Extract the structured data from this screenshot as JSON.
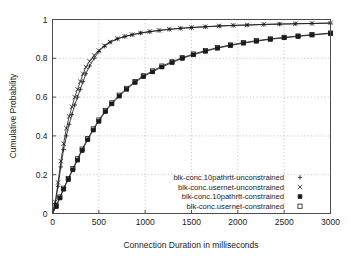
{
  "chart_data": {
    "type": "line",
    "title": "",
    "xlabel": "Connection Duration in milliseconds",
    "ylabel": "Cumulative Probability",
    "xlim": [
      0,
      3000
    ],
    "ylim": [
      0,
      1
    ],
    "xticks": [
      0,
      500,
      1000,
      1500,
      2000,
      2500,
      3000
    ],
    "xtick_labels": [
      "0",
      "500",
      "1000",
      "1500",
      "2000",
      "2500",
      "3000"
    ],
    "yticks": [
      0,
      0.2,
      0.4,
      0.6,
      0.8,
      1
    ],
    "ytick_labels": [
      "0",
      "0.2",
      "0.4",
      "0.6",
      "0.8",
      "1"
    ],
    "grid": true,
    "legend_position": "lower-right-inside",
    "series": [
      {
        "name": "blk-conc.10pathrtt-unconstrained",
        "marker": "plus",
        "marker_glyph": "+",
        "x": [
          0,
          30,
          60,
          90,
          120,
          150,
          180,
          210,
          240,
          270,
          300,
          330,
          360,
          400,
          450,
          500,
          560,
          620,
          700,
          780,
          860,
          950,
          1050,
          1150,
          1260,
          1380,
          1500,
          1650,
          1800,
          1950,
          2100,
          2280,
          2450,
          2620,
          2800,
          3000
        ],
        "y": [
          0.0,
          0.05,
          0.14,
          0.24,
          0.33,
          0.4,
          0.46,
          0.51,
          0.56,
          0.6,
          0.64,
          0.68,
          0.72,
          0.76,
          0.8,
          0.835,
          0.862,
          0.882,
          0.9,
          0.912,
          0.921,
          0.93,
          0.937,
          0.943,
          0.949,
          0.954,
          0.958,
          0.962,
          0.966,
          0.969,
          0.971,
          0.974,
          0.976,
          0.978,
          0.979,
          0.981
        ]
      },
      {
        "name": "blk-conc.usernet-unconstrained",
        "marker": "cross",
        "marker_glyph": "×",
        "x": [
          0,
          30,
          60,
          90,
          120,
          150,
          180,
          210,
          240,
          270,
          300,
          330,
          360,
          400,
          450,
          500,
          560,
          620,
          700,
          780,
          860,
          950,
          1050,
          1150,
          1260,
          1380,
          1500,
          1650,
          1800,
          1950,
          2100,
          2280,
          2450,
          2620,
          2800,
          3000
        ],
        "y": [
          0.0,
          0.06,
          0.16,
          0.27,
          0.36,
          0.44,
          0.5,
          0.55,
          0.6,
          0.64,
          0.68,
          0.72,
          0.755,
          0.785,
          0.815,
          0.84,
          0.865,
          0.884,
          0.901,
          0.913,
          0.922,
          0.931,
          0.938,
          0.944,
          0.95,
          0.955,
          0.959,
          0.963,
          0.967,
          0.97,
          0.972,
          0.975,
          0.977,
          0.978,
          0.98,
          0.982
        ]
      },
      {
        "name": "blk-conc.10pathrtt-constrained",
        "marker": "filled-square",
        "marker_glyph": "■",
        "x": [
          0,
          40,
          80,
          120,
          170,
          220,
          270,
          320,
          380,
          440,
          500,
          570,
          640,
          720,
          800,
          890,
          980,
          1080,
          1180,
          1290,
          1400,
          1520,
          1650,
          1780,
          1920,
          2060,
          2200,
          2350,
          2500,
          2650,
          2800,
          3000
        ],
        "y": [
          0.0,
          0.035,
          0.08,
          0.125,
          0.175,
          0.225,
          0.275,
          0.325,
          0.38,
          0.43,
          0.475,
          0.525,
          0.565,
          0.605,
          0.64,
          0.675,
          0.705,
          0.73,
          0.755,
          0.778,
          0.8,
          0.818,
          0.836,
          0.852,
          0.866,
          0.878,
          0.888,
          0.898,
          0.906,
          0.913,
          0.92,
          0.928
        ]
      },
      {
        "name": "blk-conc.usernet-constrained",
        "marker": "open-square",
        "marker_glyph": "□",
        "x": [
          0,
          40,
          80,
          120,
          170,
          220,
          270,
          320,
          380,
          440,
          500,
          570,
          640,
          720,
          800,
          890,
          980,
          1080,
          1180,
          1290,
          1400,
          1520,
          1650,
          1780,
          1920,
          2060,
          2200,
          2350,
          2500,
          2650,
          2800,
          3000
        ],
        "y": [
          0.0,
          0.04,
          0.085,
          0.13,
          0.18,
          0.232,
          0.282,
          0.332,
          0.386,
          0.436,
          0.482,
          0.53,
          0.57,
          0.61,
          0.645,
          0.68,
          0.71,
          0.735,
          0.76,
          0.782,
          0.803,
          0.822,
          0.84,
          0.855,
          0.869,
          0.881,
          0.891,
          0.9,
          0.908,
          0.915,
          0.922,
          0.93
        ]
      }
    ]
  },
  "legend": {
    "entries": [
      {
        "label": "blk-conc.10pathrtt-unconstrained",
        "glyph": "+"
      },
      {
        "label": "blk-conc.usernet-unconstrained",
        "glyph": "×"
      },
      {
        "label": "blk-conc.10pathrtt-constrained",
        "glyph": "■"
      },
      {
        "label": "blk-conc.usernet-constrained",
        "glyph": "□"
      }
    ]
  },
  "colors": {
    "background": "#ffffff",
    "ink": "#1a1a1a",
    "frame": "#4d4d4d",
    "grid": "#b3b3b3"
  }
}
